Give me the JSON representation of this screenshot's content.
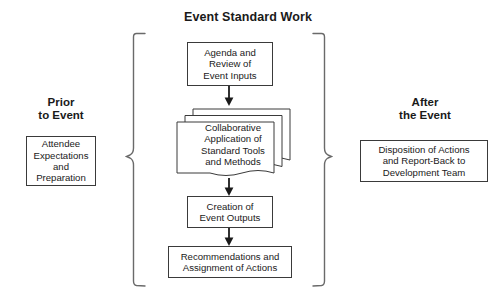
{
  "diagram": {
    "title": "Event Standard Work",
    "background_color": "#ffffff",
    "line_color": "#3a3a3a",
    "text_color": "#1a1a1a",
    "left_section": {
      "heading": "Prior\nto Event",
      "box": "Attendee\nExpectations\nand\nPreparation"
    },
    "right_section": {
      "heading": "After\nthe Event",
      "box": "Disposition of Actions\nand Report-Back to\nDevelopment Team"
    },
    "center_flow": {
      "step_1": "Agenda and\nReview of\nEvent Inputs",
      "step_2": "Collaborative\nApplication of\nStandard Tools\nand Methods",
      "step_3": "Creation of\nEvent Outputs",
      "step_4": "Recommendations and\nAssignment of Actions"
    },
    "connectors": [
      "arrow-down-step1-to-step2",
      "arrow-down-step2-to-step3",
      "arrow-down-step3-to-step4"
    ],
    "brackets": [
      "left-curly-bracket",
      "right-curly-bracket"
    ]
  }
}
